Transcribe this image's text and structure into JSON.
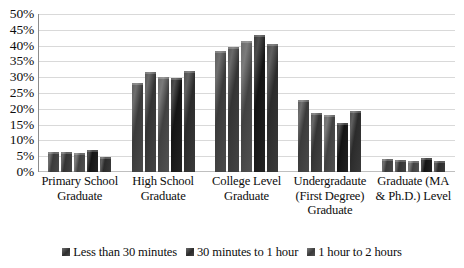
{
  "chart_data": {
    "type": "bar",
    "title": "",
    "subtitle": "",
    "xlabel": "",
    "ylabel": "",
    "ylim": [
      0,
      50
    ],
    "ytick_step": 5,
    "ytick_labels": [
      "50%",
      "45%",
      "40%",
      "35%",
      "30%",
      "25%",
      "20%",
      "15%",
      "10%",
      "5%",
      "0%"
    ],
    "grid": true,
    "legend_position": "bottom",
    "orientation": "vertical",
    "value_suffix": "%",
    "categories": [
      "Primary School Graduate",
      "High School Graduate",
      "College Level Graduate",
      "Undergradaute (First Degree) Graduate",
      "Graduate (MA & Ph.D.) Level"
    ],
    "category_lines": [
      [
        "Primary School",
        "Graduate"
      ],
      [
        "High School",
        "Graduate"
      ],
      [
        "College Level",
        "Graduate"
      ],
      [
        "Undergradaute",
        "(First Degree)",
        "Graduate"
      ],
      [
        "Graduate (MA",
        "& Ph.D.) Level"
      ]
    ],
    "series": [
      {
        "name": "Less than 30 minutes",
        "values": [
          6.2,
          28.1,
          38.4,
          22.8,
          4.0
        ]
      },
      {
        "name": "30 minutes to 1 hour",
        "values": [
          6.4,
          31.7,
          39.7,
          18.6,
          3.7
        ]
      },
      {
        "name": "1 hour to 2 hours",
        "values": [
          6.0,
          30.0,
          41.6,
          17.9,
          3.5
        ]
      },
      {
        "name": "",
        "values": [
          6.9,
          29.6,
          43.4,
          15.4,
          4.3
        ]
      },
      {
        "name": "",
        "values": [
          4.6,
          31.9,
          40.4,
          19.2,
          3.4
        ]
      }
    ],
    "legend_entries": [
      {
        "label": "Less than 30 minutes",
        "swatch": "legend-swatch-series-0"
      },
      {
        "label": "30 minutes to 1 hour",
        "swatch": "legend-swatch-series-1"
      },
      {
        "label": "1 hour to 2 hours",
        "swatch": "legend-swatch-series-2"
      }
    ],
    "colors": {
      "gridline": "#d9d9d9",
      "axis": "#8c8c8c",
      "text": "#0d0d0d",
      "background": "#ffffff",
      "series_0": "#4a4a4a",
      "series_1": "#444444",
      "series_2": "#525252",
      "series_3": "#232323",
      "series_4": "#3a3a3a"
    }
  }
}
